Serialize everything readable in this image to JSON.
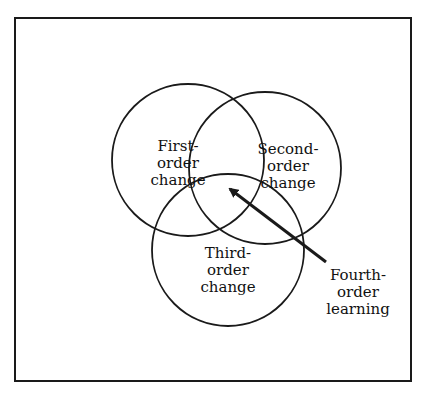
{
  "diagram": {
    "type": "venn",
    "circles": [
      {
        "id": "first",
        "lines": [
          "First-",
          "order",
          "change"
        ],
        "cx": 188,
        "cy": 160,
        "r": 76
      },
      {
        "id": "second",
        "lines": [
          "Second-",
          "order",
          "change"
        ],
        "cx": 265,
        "cy": 168,
        "r": 76
      },
      {
        "id": "third",
        "lines": [
          "Third-",
          "order",
          "change"
        ],
        "cx": 228,
        "cy": 250,
        "r": 76
      }
    ],
    "pointer": {
      "lines": [
        "Fourth-",
        "order",
        "learning"
      ],
      "from": [
        326,
        262
      ],
      "to": [
        226,
        185
      ]
    },
    "colors": {
      "stroke": "#1a1a1a",
      "background": "#ffffff"
    }
  }
}
